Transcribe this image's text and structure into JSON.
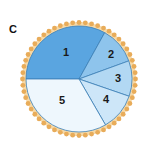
{
  "panel_label": "C",
  "diagram": {
    "type": "cell-sectors",
    "center": [
      79,
      79
    ],
    "radius": 53,
    "membrane_color": "#e8ac5a",
    "membrane_bg": "#f7d9a6",
    "boundary_color": "#3a7fb8",
    "sectors": [
      {
        "label": "1",
        "start_deg": 180,
        "end_deg": 299,
        "color": "#5aa5e0",
        "label_pos": [
          63,
          56
        ]
      },
      {
        "label": "2",
        "start_deg": 299,
        "end_deg": 340,
        "color": "#8ec4ec",
        "label_pos": [
          108,
          58
        ]
      },
      {
        "label": "3",
        "start_deg": 340,
        "end_deg": 19,
        "color": "#b2d8f3",
        "label_pos": [
          115,
          82
        ]
      },
      {
        "label": "4",
        "start_deg": 19,
        "end_deg": 60,
        "color": "#cde6f8",
        "label_pos": [
          103,
          103
        ]
      },
      {
        "label": "5",
        "start_deg": 60,
        "end_deg": 180,
        "color": "#eef7fd",
        "label_pos": [
          59,
          104
        ]
      }
    ]
  }
}
